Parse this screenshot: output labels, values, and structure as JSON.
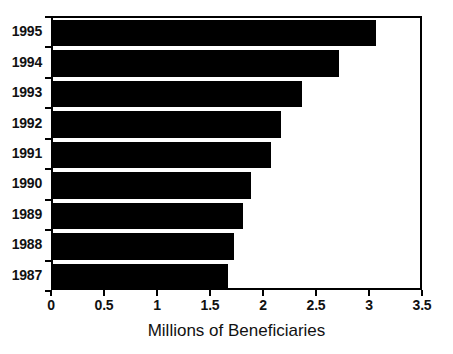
{
  "chart_data": {
    "type": "bar",
    "orientation": "horizontal",
    "title": "",
    "xlabel": "Millions of Beneficiaries",
    "ylabel": "",
    "categories": [
      "1995",
      "1994",
      "1993",
      "1992",
      "1991",
      "1990",
      "1989",
      "1988",
      "1987"
    ],
    "values": [
      3.05,
      2.7,
      2.35,
      2.15,
      2.06,
      1.87,
      1.79,
      1.71,
      1.65
    ],
    "xlim": [
      0,
      3.5
    ],
    "xticks": [
      "0",
      "0.5",
      "1",
      "1.5",
      "2",
      "2.5",
      "3",
      "3.5"
    ],
    "xtick_values": [
      0,
      0.5,
      1,
      1.5,
      2,
      2.5,
      3,
      3.5
    ],
    "grid": false,
    "legend": null,
    "bar_color": "#000000",
    "background_color": "#ffffff",
    "axis_color": "#000000"
  }
}
